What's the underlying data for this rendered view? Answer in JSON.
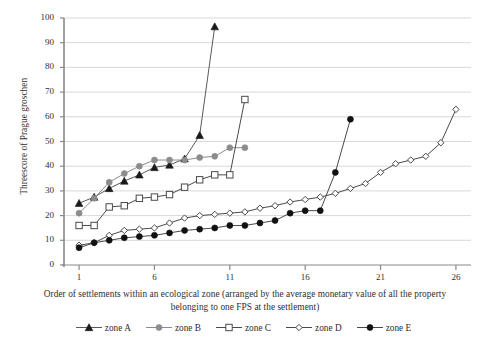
{
  "chart_data": {
    "type": "line",
    "title": "",
    "xlabel": "Order of settlements within an ecological zone (arranged by the average monetary value of all the property belonging to one FPS at the settlement)",
    "ylabel": "Threescore of Prague groschen",
    "xlim": [
      0,
      27
    ],
    "ylim": [
      0,
      100
    ],
    "xticks": [
      1,
      6,
      11,
      16,
      21,
      26
    ],
    "yticks": [
      0,
      10,
      20,
      30,
      40,
      50,
      60,
      70,
      80,
      90,
      100
    ],
    "grid": "horizontal",
    "legend_position": "bottom",
    "series": [
      {
        "name": "zone A",
        "marker": "filled-triangle",
        "color": "#1a1a1a",
        "line_color": "#5a5a5a",
        "x": [
          1,
          2,
          3,
          4,
          5,
          6,
          7,
          8,
          9,
          10
        ],
        "values": [
          25,
          27.5,
          31,
          34,
          36.5,
          39.5,
          40.5,
          43,
          52.5,
          96.5
        ]
      },
      {
        "name": "zone B",
        "marker": "filled-circle",
        "color": "#8c8c8c",
        "line_color": "#8c8c8c",
        "x": [
          1,
          2,
          3,
          4,
          5,
          6,
          7,
          8,
          9,
          10,
          11,
          12
        ],
        "values": [
          21,
          27,
          33.5,
          37,
          40,
          42.5,
          42.5,
          42.5,
          43.5,
          44,
          47.5,
          47.5
        ]
      },
      {
        "name": "zone C",
        "marker": "open-square",
        "color": "#ffffff",
        "line_color": "#4a4a4a",
        "x": [
          1,
          2,
          3,
          4,
          5,
          6,
          7,
          8,
          9,
          10,
          11,
          12
        ],
        "values": [
          16,
          16,
          23.5,
          24,
          27,
          27.5,
          28.5,
          31.5,
          34.5,
          36.5,
          36.5,
          67
        ]
      },
      {
        "name": "zone D",
        "marker": "open-diamond",
        "color": "#ffffff",
        "line_color": "#4a4a4a",
        "x": [
          1,
          2,
          3,
          4,
          5,
          6,
          7,
          8,
          9,
          10,
          11,
          12,
          13,
          14,
          15,
          16,
          17,
          18,
          19,
          20,
          21,
          22,
          23,
          24,
          25,
          26
        ],
        "values": [
          8,
          9,
          12,
          14,
          14.5,
          15,
          17,
          19,
          20,
          20.5,
          21,
          21.5,
          23,
          24,
          25.5,
          26.5,
          27.5,
          29,
          31,
          33,
          37.5,
          41,
          42.5,
          44,
          49.5,
          63
        ]
      },
      {
        "name": "zone E",
        "marker": "filled-circle",
        "color": "#111111",
        "line_color": "#4a4a4a",
        "x": [
          1,
          2,
          3,
          4,
          5,
          6,
          7,
          8,
          9,
          10,
          11,
          12,
          13,
          14,
          15,
          16,
          17,
          18,
          19
        ],
        "values": [
          7,
          9,
          10,
          11,
          11.5,
          12,
          13,
          14,
          14.5,
          15,
          16,
          16,
          17,
          18,
          21,
          22,
          22,
          37.5,
          59
        ]
      }
    ]
  },
  "legend": {
    "items": [
      {
        "label": "zone A"
      },
      {
        "label": "zone B"
      },
      {
        "label": "zone C"
      },
      {
        "label": "zone D"
      },
      {
        "label": "zone E"
      }
    ]
  }
}
